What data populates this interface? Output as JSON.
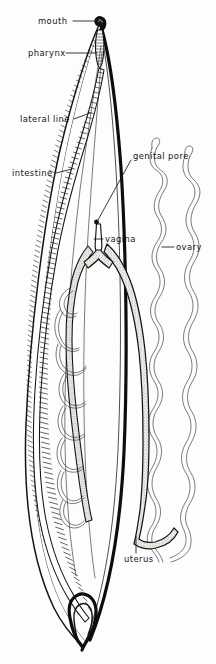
{
  "figure": {
    "background_color": "#fdfdfd",
    "ink_color": "#141414",
    "width": 216,
    "height": 664
  },
  "labels": [
    {
      "id": "mouth",
      "text": "mouth",
      "x": 38,
      "y": 24,
      "anchor": "start"
    },
    {
      "id": "pharynx",
      "text": "pharynx",
      "x": 28,
      "y": 56,
      "anchor": "start"
    },
    {
      "id": "lateral-line",
      "text": "lateral line",
      "x": 20,
      "y": 122,
      "anchor": "start"
    },
    {
      "id": "intestine",
      "text": "intestine",
      "x": 12,
      "y": 176,
      "anchor": "start"
    },
    {
      "id": "genital-pore",
      "text": "genital pore",
      "x": 133,
      "y": 159,
      "anchor": "start"
    },
    {
      "id": "vagina",
      "text": "vagina",
      "x": 105,
      "y": 242,
      "anchor": "start"
    },
    {
      "id": "ovary",
      "text": "ovary",
      "x": 176,
      "y": 250,
      "anchor": "start"
    },
    {
      "id": "uterus",
      "text": "uterus",
      "x": 124,
      "y": 562,
      "anchor": "start"
    }
  ],
  "structures": [
    {
      "id": "body-wall",
      "name": "body wall outline"
    },
    {
      "id": "cuticle",
      "name": "cuticle with hatching"
    },
    {
      "id": "pharynx-organ",
      "name": "pharynx"
    },
    {
      "id": "intestine-organ",
      "name": "intestine"
    },
    {
      "id": "lateral-line-organ",
      "name": "lateral line"
    },
    {
      "id": "vagina-organ",
      "name": "vagina"
    },
    {
      "id": "uterus-organ",
      "name": "uterus"
    },
    {
      "id": "ovary-organ",
      "name": "ovary"
    },
    {
      "id": "genital-pore-organ",
      "name": "genital pore"
    }
  ]
}
